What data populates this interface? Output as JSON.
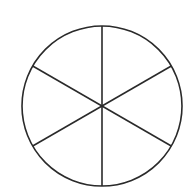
{
  "diagram": {
    "type": "circle-divided-into-sectors",
    "sectors": 6,
    "center": [
      102,
      106
    ],
    "radius": 80,
    "stroke_color": "#2a2a2a",
    "background": "#ffffff"
  }
}
